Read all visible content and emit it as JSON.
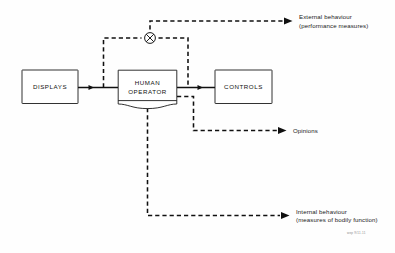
{
  "diagram": {
    "colors": {
      "ink": "#101010",
      "background": "#fefefe",
      "box_fill": "#ffffff"
    },
    "blocks": [
      {
        "id": "displays",
        "label": "DISPLAYS"
      },
      {
        "id": "human-operator",
        "label_line1": "HUMAN",
        "label_line2": "OPERATOR"
      },
      {
        "id": "controls",
        "label": "CONTROLS"
      }
    ],
    "junction": {
      "id": "summing-junction",
      "symbol": "crossed-circle"
    },
    "outputs": [
      {
        "id": "external-behaviour",
        "line1": "External behaviour",
        "line2": "(performance measures)"
      },
      {
        "id": "opinions",
        "line1": "Opinions",
        "line2": ""
      },
      {
        "id": "internal-behaviour",
        "line1": "Internal behaviour",
        "line2": "(measures of bodily function)"
      }
    ],
    "figure_code": "wep 9/11.11"
  }
}
